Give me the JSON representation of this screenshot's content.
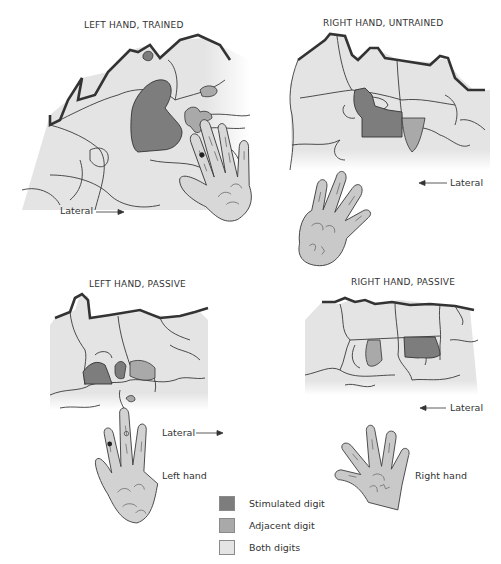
{
  "colors": {
    "stimulated": "#7d7d7d",
    "adjacent": "#a9a9a9",
    "both": "#e4e4e4",
    "outline": "#333333",
    "boundary": "#3a3a3a"
  },
  "panels": [
    {
      "id": "left-trained",
      "title": "LEFT HAND, TRAINED",
      "direction_label": "Lateral",
      "arrow": "right"
    },
    {
      "id": "right-untrained",
      "title": "RIGHT HAND, UNTRAINED",
      "direction_label": "Lateral",
      "arrow": "left"
    },
    {
      "id": "left-passive",
      "title": "LEFT HAND, PASSIVE",
      "direction_label": "Lateral",
      "arrow": "right",
      "hand_label": "Left hand"
    },
    {
      "id": "right-passive",
      "title": "RIGHT HAND, PASSIVE",
      "direction_label": "Lateral",
      "arrow": "left",
      "hand_label": "Right hand"
    }
  ],
  "legend": {
    "items": [
      {
        "label": "Stimulated digit",
        "color": "#7d7d7d"
      },
      {
        "label": "Adjacent digit",
        "color": "#a9a9a9"
      },
      {
        "label": "Both digits",
        "color": "#e4e4e4"
      }
    ]
  }
}
